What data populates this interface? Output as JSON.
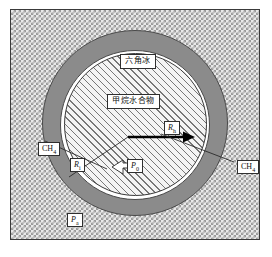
{
  "figure": {
    "regions": {
      "outer_medium_label": "Pₐ",
      "ice_shell_label": "六角冰",
      "hydrate_core_label": "甲烷水合物"
    },
    "labels": {
      "hex_ice": "六角冰",
      "methane_hydrate": "甲烷水合物",
      "radius_outer_symbol": "R",
      "radius_outer_sub": "h",
      "radius_inner_symbol": "R",
      "radius_inner_sub": "i",
      "pressure_core_symbol": "P",
      "pressure_core_sub": "0",
      "pressure_outer_symbol": "P",
      "pressure_outer_sub": "a",
      "methane_left": "CH",
      "methane_left_sub": "4",
      "methane_right": "CH",
      "methane_right_sub": "4"
    },
    "colors": {
      "ice_shell_fill": "#8b8b8b",
      "gap_ring_fill": "#ffffff",
      "hydrate_hatch": "#777777",
      "water_checker": "#9a9a9a",
      "frame_border": "#3a3a3a",
      "arrow": "#000000"
    },
    "geometry": {
      "frame_width_px": 250,
      "frame_height_px": 231,
      "ice_shell_diameter_px": 186,
      "gap_ring_diameter_px": 150,
      "hydrate_core_diameter_px": 143
    }
  }
}
